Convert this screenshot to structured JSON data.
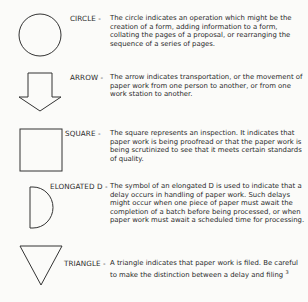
{
  "symbols": [
    {
      "shape": "circle",
      "term": "CIRCLE -",
      "description": "The circle indicates an operation which might be the creation of a form, adding information to a form, collating the pages of a proposal, or rearranging the sequence of a series of pages."
    },
    {
      "shape": "arrow",
      "term": "ARROW -",
      "description": "The arrow indicates transportation, or the movement of paper work from one person to another, or from one work station to another."
    },
    {
      "shape": "square",
      "term": "SQUARE -",
      "description": "The square represents an inspection. It indicates that paper work is being proofread or that the paper work is being scrutinized to see that it meets certain standards of quality."
    },
    {
      "shape": "elongated-d",
      "term": "ELONGATED D -",
      "description": "The symbol of an elongated D is used to indicate that a delay occurs in handling of paper work. Such delays might occur when one piece of paper must await the completion of a batch before being processed, or when paper work must await a scheduled time for processing."
    },
    {
      "shape": "triangle",
      "term": "TRIANGLE -",
      "description": "A triangle indicates that paper work is filed. Be careful to make the distinction between a delay and filing",
      "footnote": "3"
    }
  ],
  "colors": {
    "background": "#fbfbf9",
    "ink": "#2a2a2a"
  }
}
